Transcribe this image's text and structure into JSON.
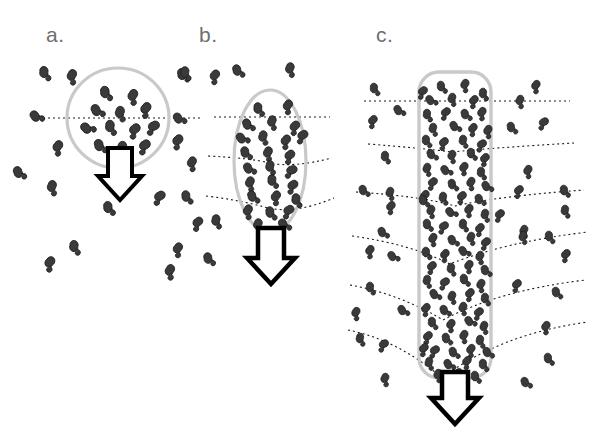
{
  "figure": {
    "type": "scientific-diagram",
    "background_color": "#ffffff",
    "width": 600,
    "height": 435
  },
  "style": {
    "particle_fill": "#3a3a3a",
    "particle_stroke": "#1c1c1c",
    "boundary_stroke": "#c9c9c9",
    "boundary_stroke_width": 3,
    "flowline_stroke": "#1a1a1a",
    "flowline_dash": "2 3",
    "arrow_fill": "#ffffff",
    "arrow_stroke": "#000000",
    "label_color": "#6e6e6e"
  },
  "panels": [
    {
      "id": "a",
      "label": "a.",
      "label_x": 46,
      "label_y": 42,
      "boundary_shape": "circle",
      "boundary": {
        "cx": 118,
        "cy": 118,
        "rx": 51,
        "ry": 50
      },
      "particle_count_inside": 13,
      "particle_count_outside": 12,
      "flowlines": 1,
      "arrow": {
        "cx": 120,
        "top": 148,
        "width": 26,
        "height": 50
      },
      "flowline_paths": [
        "M 38 118 L 200 118"
      ],
      "particles_inside": [
        {
          "x": 105,
          "y": 92,
          "r": -20
        },
        {
          "x": 133,
          "y": 95,
          "r": 15
        },
        {
          "x": 96,
          "y": 110,
          "r": -40
        },
        {
          "x": 120,
          "y": 112,
          "r": 0
        },
        {
          "x": 146,
          "y": 108,
          "r": 25
        },
        {
          "x": 86,
          "y": 128,
          "r": -60
        },
        {
          "x": 110,
          "y": 126,
          "r": -10
        },
        {
          "x": 135,
          "y": 129,
          "r": 35
        },
        {
          "x": 154,
          "y": 126,
          "r": 50
        },
        {
          "x": 99,
          "y": 145,
          "r": -30
        },
        {
          "x": 122,
          "y": 147,
          "r": 10
        },
        {
          "x": 145,
          "y": 145,
          "r": 40
        },
        {
          "x": 116,
          "y": 160,
          "r": -5
        }
      ],
      "particles_outside": [
        {
          "x": 44,
          "y": 72,
          "r": -15
        },
        {
          "x": 72,
          "y": 75,
          "r": 10
        },
        {
          "x": 182,
          "y": 74,
          "r": -25
        },
        {
          "x": 35,
          "y": 116,
          "r": -50
        },
        {
          "x": 58,
          "y": 146,
          "r": 20
        },
        {
          "x": 178,
          "y": 140,
          "r": 30
        },
        {
          "x": 18,
          "y": 172,
          "r": -35
        },
        {
          "x": 52,
          "y": 186,
          "r": 5
        },
        {
          "x": 108,
          "y": 207,
          "r": -20
        },
        {
          "x": 160,
          "y": 196,
          "r": 45
        },
        {
          "x": 74,
          "y": 246,
          "r": -10
        },
        {
          "x": 50,
          "y": 262,
          "r": 25
        },
        {
          "x": 170,
          "y": 270,
          "r": 15
        }
      ]
    },
    {
      "id": "b",
      "label": "b.",
      "label_x": 199,
      "label_y": 42,
      "boundary_shape": "ellipse",
      "boundary": {
        "cx": 270,
        "cy": 161,
        "rx": 36,
        "ry": 71
      },
      "particle_count_inside": 26,
      "particle_count_outside": 11,
      "flowlines": 3,
      "arrow": {
        "cx": 271,
        "top": 228,
        "width": 28,
        "height": 54
      },
      "flowline_paths": [
        "M 214 117 L 330 117",
        "M 208 156 Q 250 158 270 163 Q 292 168 332 158",
        "M 206 196 Q 240 200 268 208 Q 296 214 334 198"
      ],
      "particles_inside": [
        {
          "x": 258,
          "y": 108,
          "r": -15
        },
        {
          "x": 288,
          "y": 105,
          "r": 20
        },
        {
          "x": 247,
          "y": 124,
          "r": -35
        },
        {
          "x": 272,
          "y": 121,
          "r": 5
        },
        {
          "x": 295,
          "y": 126,
          "r": 30
        },
        {
          "x": 241,
          "y": 138,
          "r": -50
        },
        {
          "x": 263,
          "y": 136,
          "r": 0
        },
        {
          "x": 286,
          "y": 140,
          "r": 25
        },
        {
          "x": 303,
          "y": 135,
          "r": 45
        },
        {
          "x": 245,
          "y": 152,
          "r": -25
        },
        {
          "x": 268,
          "y": 152,
          "r": 12
        },
        {
          "x": 290,
          "y": 155,
          "r": 35
        },
        {
          "x": 248,
          "y": 168,
          "r": -40
        },
        {
          "x": 270,
          "y": 166,
          "r": -5
        },
        {
          "x": 292,
          "y": 170,
          "r": 55
        },
        {
          "x": 250,
          "y": 182,
          "r": 10
        },
        {
          "x": 272,
          "y": 180,
          "r": -15
        },
        {
          "x": 293,
          "y": 185,
          "r": 40
        },
        {
          "x": 252,
          "y": 196,
          "r": -30
        },
        {
          "x": 276,
          "y": 196,
          "r": 20
        },
        {
          "x": 296,
          "y": 199,
          "r": -10
        },
        {
          "x": 248,
          "y": 210,
          "r": 15
        },
        {
          "x": 270,
          "y": 212,
          "r": -20
        },
        {
          "x": 289,
          "y": 210,
          "r": 45
        },
        {
          "x": 258,
          "y": 224,
          "r": 5
        },
        {
          "x": 283,
          "y": 224,
          "r": -40
        }
      ],
      "particles_outside": [
        {
          "x": 185,
          "y": 72,
          "r": -10
        },
        {
          "x": 215,
          "y": 75,
          "r": 25
        },
        {
          "x": 237,
          "y": 70,
          "r": -30
        },
        {
          "x": 290,
          "y": 68,
          "r": 5
        },
        {
          "x": 178,
          "y": 118,
          "r": -45
        },
        {
          "x": 192,
          "y": 162,
          "r": 15
        },
        {
          "x": 186,
          "y": 196,
          "r": -20
        },
        {
          "x": 198,
          "y": 222,
          "r": 35
        },
        {
          "x": 216,
          "y": 220,
          "r": -5
        },
        {
          "x": 178,
          "y": 248,
          "r": 20
        },
        {
          "x": 208,
          "y": 258,
          "r": -25
        }
      ]
    },
    {
      "id": "c",
      "label": "c.",
      "label_x": 376,
      "label_y": 42,
      "boundary_shape": "rounded-rectangle",
      "boundary": {
        "x": 419,
        "y": 72,
        "width": 72,
        "height": 306,
        "radius": 20
      },
      "particle_count_inside": 88,
      "particle_count_outside": 34,
      "flowlines": 6,
      "arrow": {
        "cx": 455,
        "top": 372,
        "width": 28,
        "height": 52
      },
      "flowline_paths": [
        "M 364 101 L 570 101",
        "M 368 144 Q 420 148 452 152 Q 490 148 574 143",
        "M 356 192 Q 420 196 455 206 Q 500 196 584 190",
        "M 352 236 Q 410 244 450 264 Q 505 242 588 232",
        "M 350 285 Q 400 294 443 320 Q 500 290 586 280",
        "M 348 330 Q 398 340 442 378 Q 500 334 588 322"
      ]
    }
  ]
}
